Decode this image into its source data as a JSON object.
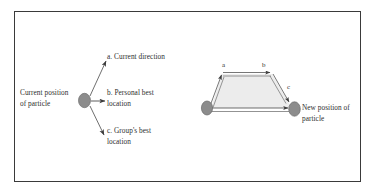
{
  "figure": {
    "background_color": "#ffffff",
    "frame_color": "#3a3a3a",
    "ellipse_fill": "#8c8c8c",
    "ellipse_stroke": "#5a5a5a",
    "line_color": "#4a4a4a",
    "trapezoid_fill": "#ececec"
  },
  "left_diagram": {
    "source_label": "Current position\nof particle",
    "branches": [
      {
        "key": "a",
        "label": "a. Current direction"
      },
      {
        "key": "b",
        "label": "b. Personal best\nlocation"
      },
      {
        "key": "c",
        "label": "c. Group's best\nlocation"
      }
    ]
  },
  "right_diagram": {
    "vectors": [
      {
        "key": "a",
        "label": "a"
      },
      {
        "key": "b",
        "label": "b"
      },
      {
        "key": "c",
        "label": "c"
      }
    ],
    "result_label": "New position of\nparticle"
  }
}
